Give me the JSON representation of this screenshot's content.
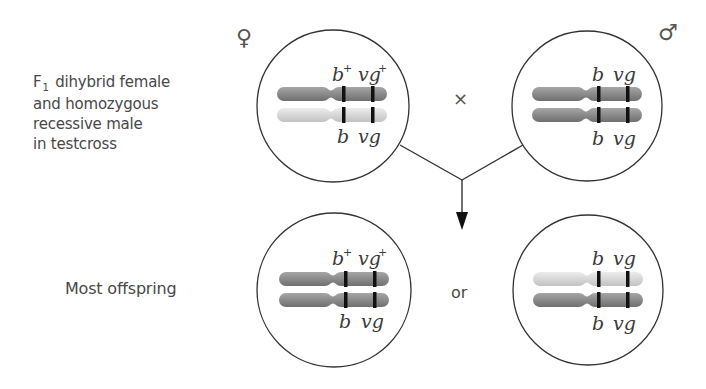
{
  "labels": {
    "parental_line1_prefix": "F",
    "parental_line1_sub": "1",
    "parental_line1_rest": "dihybrid female",
    "parental_line2": "and homozygous",
    "parental_line3": "recessive male",
    "parental_line4": "in testcross",
    "offspring": "Most offspring",
    "or": "or",
    "cross": "×"
  },
  "symbols": {
    "female": "♀",
    "male": "♂"
  },
  "colors": {
    "dark_chromosome": "#8e8e8e",
    "light_chromosome": "#d8d8d8",
    "band": "#111111",
    "outline": "#333333"
  },
  "cells": [
    {
      "id": "female-parent",
      "top_alleles": [
        "b",
        "+",
        "vg",
        "+"
      ],
      "bottom_alleles": [
        "b",
        "",
        "vg",
        ""
      ],
      "top_chromosome": "dark",
      "bottom_chromosome": "light"
    },
    {
      "id": "male-parent",
      "top_alleles": [
        "b",
        "",
        "vg",
        ""
      ],
      "bottom_alleles": [
        "b",
        "",
        "vg",
        ""
      ],
      "top_chromosome": "dark",
      "bottom_chromosome": "dark"
    },
    {
      "id": "offspring-wild-type",
      "top_alleles": [
        "b",
        "+",
        "vg",
        "+"
      ],
      "bottom_alleles": [
        "b",
        "",
        "vg",
        ""
      ],
      "top_chromosome": "dark",
      "bottom_chromosome": "dark"
    },
    {
      "id": "offspring-recessive",
      "top_alleles": [
        "b",
        "",
        "vg",
        ""
      ],
      "bottom_alleles": [
        "b",
        "",
        "vg",
        ""
      ],
      "top_chromosome": "light",
      "bottom_chromosome": "dark"
    }
  ]
}
